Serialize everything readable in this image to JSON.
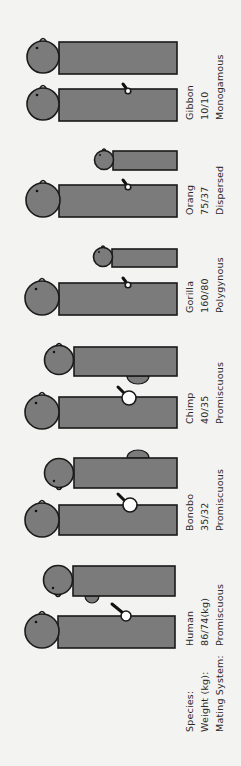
{
  "row_labels": {
    "species": "Species:",
    "weight": "Weight (kg):",
    "mating": "Mating System:"
  },
  "species": [
    {
      "name": "Human",
      "weight": "86/74(kg)",
      "mating": "Promiscuous"
    },
    {
      "name": "Bonobo",
      "weight": "35/32",
      "mating": "Promiscuous"
    },
    {
      "name": "Chimp",
      "weight": "40/35",
      "mating": "Promiscuous"
    },
    {
      "name": "Gorilla",
      "weight": "160/80",
      "mating": "Polygynous"
    },
    {
      "name": "Orang",
      "weight": "75/37",
      "mating": "Dispersed"
    },
    {
      "name": "Gibbon",
      "weight": "10/10",
      "mating": "Monogamous"
    }
  ],
  "colors": {
    "background": "#f3f3f1",
    "figure_fill": "#7b7b7b",
    "outline": "#1a1a1a",
    "testis_fill": "#ffffff"
  }
}
